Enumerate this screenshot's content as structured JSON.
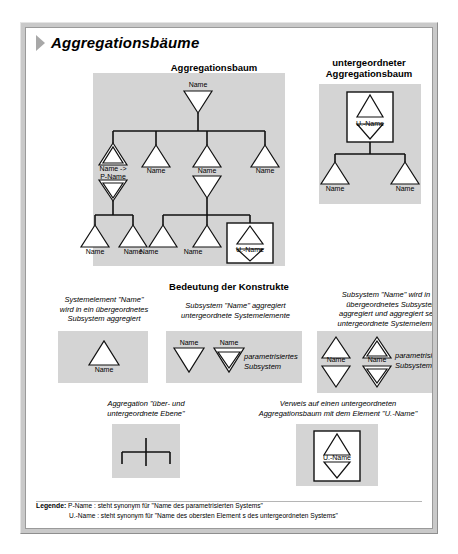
{
  "document": {
    "title": "Aggregationsbäume",
    "title_marker": "triangle-right-bullet"
  },
  "sections": {
    "tree_main_heading": "Aggregationsbaum",
    "tree_sub_heading_line1": "untergeordneter",
    "tree_sub_heading_line2": "Aggregationsbaum",
    "constructs_heading": "Bedeutung der Konstrukte"
  },
  "labels": {
    "name": "Name",
    "u_name": "U.-Name",
    "name_arrow_p_name_line1": "Name ->",
    "name_arrow_p_name_line2": "P-Name",
    "parametrisiertes_line1": "parametrisiertes",
    "parametrisiertes_line2": "Subsystem"
  },
  "main_tree": {
    "root": "Name",
    "level1": [
      "Name -> P-Name",
      "Name",
      "Name",
      "Name"
    ],
    "level2_left": [
      "Name",
      "Name"
    ],
    "level2_right": [
      "Name",
      "Name",
      "U.-Name"
    ]
  },
  "sub_tree": {
    "root": "U.-Name",
    "children": [
      "Name",
      "Name"
    ]
  },
  "constructs": [
    {
      "id": "construct-1",
      "caption": [
        "Systemelement \"Name\"",
        "wird in ein übergeordnetes",
        "Subsystem aggregiert"
      ],
      "node_labels": [
        "Name"
      ]
    },
    {
      "id": "construct-2",
      "caption": [
        "Subsystem \"Name\" aggregiert",
        "untergeordnete Systemelemente"
      ],
      "node_labels": [
        "Name",
        "Name"
      ],
      "side_note": [
        "parametrisiertes",
        "Subsystem"
      ]
    },
    {
      "id": "construct-3",
      "caption": [
        "Subsystem \"Name\" wird in ein",
        "übergeordnetes Subsystem",
        "aggregiert und aggregiert selbst",
        "untergeordnete Systemelemente"
      ],
      "node_labels": [
        "Name",
        "Name"
      ],
      "side_note": [
        "parametrisiertes",
        "Subsystem"
      ]
    },
    {
      "id": "construct-4",
      "caption": [
        "Aggregation \"über- und",
        "untergeordnete Ebene\""
      ],
      "node_labels": []
    },
    {
      "id": "construct-5",
      "caption": [
        "Verweis auf einen untergeordneten",
        "Aggregationsbaum mit dem Element \"U.-Name\""
      ],
      "node_labels": [
        "U.-Name"
      ]
    }
  ],
  "legend": {
    "title": "Legende:",
    "rows": [
      "P-Name :  steht synonym für \"Name des parametrisierten Systems\"",
      "U.-Name : steht synonym für \"Name des obersten Element s des untergeordneten Systems\""
    ]
  },
  "colors": {
    "panel_gray": "#d4d4d4",
    "frame_gray": "#c9c9c9",
    "line_black": "#111111",
    "shape_fill": "#ffffff"
  }
}
